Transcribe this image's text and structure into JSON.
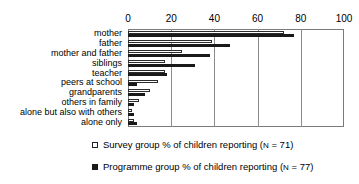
{
  "chart_data": {
    "type": "bar",
    "orientation": "horizontal",
    "title": "",
    "xlabel": "",
    "ylabel": "",
    "xlim": [
      0,
      100
    ],
    "xticks": [
      0,
      20,
      40,
      60,
      80,
      100
    ],
    "grid": true,
    "legend_position": "bottom",
    "categories": [
      "mother",
      "father",
      "mother and father",
      "siblings",
      "teacher",
      "peers at school",
      "grandparents",
      "others in family",
      "alone but also with others",
      "alone only"
    ],
    "series": [
      {
        "name": "Survey group % of children reporting (N = 71)",
        "short_name": "Survey group",
        "color": "#ffffff",
        "edge_color": "#2b2b2b",
        "n": 71,
        "values": [
          72,
          39,
          25,
          17,
          17,
          14,
          10,
          5,
          2,
          3
        ]
      },
      {
        "name": "Programme group % of children reporting (N = 77)",
        "short_name": "Programme group",
        "color": "#1a1a1a",
        "edge_color": "#1a1a1a",
        "n": 77,
        "values": [
          77,
          47,
          38,
          31,
          18,
          4,
          8,
          3,
          3,
          4
        ]
      }
    ]
  },
  "legend": [
    {
      "marker": "open-square",
      "prefix": "Survey group % of children reporting (",
      "n_symbol": "N",
      "suffix": " = 71)"
    },
    {
      "marker": "filled-square",
      "prefix": "Programme group % of children reporting (",
      "n_symbol": "N",
      "suffix": " = 77)"
    }
  ]
}
